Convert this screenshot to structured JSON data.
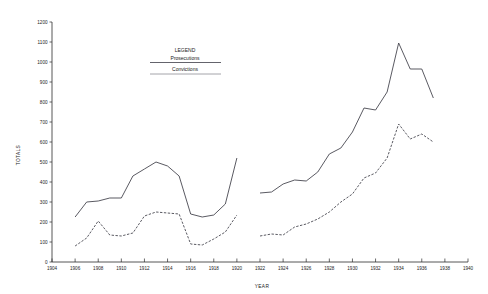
{
  "chart_data": {
    "type": "line",
    "title": "",
    "xlabel": "YEAR",
    "ylabel": "TOTALS",
    "xlim": [
      1904,
      1940
    ],
    "ylim": [
      0,
      1200
    ],
    "grid": false,
    "legend": {
      "title": "LEGEND",
      "position": "upper-center",
      "entries": [
        {
          "label": "Prosecutions",
          "style": "solid"
        },
        {
          "label": "Convictions",
          "style": "dashed"
        }
      ]
    },
    "x_ticks": [
      1904,
      1906,
      1908,
      1910,
      1912,
      1914,
      1916,
      1918,
      1920,
      1922,
      1924,
      1926,
      1928,
      1930,
      1932,
      1934,
      1936,
      1938,
      1940
    ],
    "y_ticks": [
      0,
      100,
      200,
      300,
      400,
      500,
      600,
      700,
      800,
      900,
      1000,
      1100,
      1200
    ],
    "series": [
      {
        "name": "Prosecutions",
        "style": "solid",
        "segments": [
          {
            "x": [
              1906,
              1907,
              1908,
              1909,
              1910,
              1911,
              1912,
              1913,
              1914,
              1915,
              1916,
              1917,
              1918,
              1919,
              1920
            ],
            "y": [
              225,
              300,
              305,
              320,
              320,
              430,
              465,
              500,
              480,
              430,
              240,
              225,
              235,
              290,
              520
            ]
          },
          {
            "x": [
              1922,
              1923,
              1924,
              1925,
              1926,
              1927,
              1928,
              1929,
              1930,
              1931,
              1932,
              1933,
              1934,
              1935,
              1936,
              1937
            ],
            "y": [
              345,
              350,
              390,
              410,
              405,
              450,
              540,
              570,
              650,
              770,
              760,
              850,
              1095,
              965,
              965,
              820
            ]
          }
        ]
      },
      {
        "name": "Convictions",
        "style": "dashed",
        "segments": [
          {
            "x": [
              1906,
              1907,
              1908,
              1909,
              1910,
              1911,
              1912,
              1913,
              1914,
              1915,
              1916,
              1917,
              1918,
              1919,
              1920
            ],
            "y": [
              80,
              120,
              205,
              135,
              130,
              145,
              230,
              250,
              245,
              240,
              90,
              85,
              115,
              150,
              235
            ]
          },
          {
            "x": [
              1922,
              1923,
              1924,
              1925,
              1926,
              1927,
              1928,
              1929,
              1930,
              1931,
              1932,
              1933,
              1934,
              1935,
              1936,
              1937
            ],
            "y": [
              130,
              140,
              135,
              175,
              190,
              215,
              250,
              300,
              340,
              420,
              445,
              520,
              690,
              615,
              640,
              600
            ]
          }
        ]
      }
    ]
  },
  "axes": {
    "y_title": "TOTALS",
    "x_title": "YEAR",
    "y_tick_labels": [
      "0",
      "100",
      "200",
      "300",
      "400",
      "500",
      "600",
      "700",
      "800",
      "900",
      "1000",
      "1100",
      "1200"
    ],
    "x_tick_labels": [
      "1904",
      "1906",
      "1908",
      "1910",
      "1912",
      "1914",
      "1916",
      "1918",
      "1920",
      "1922",
      "1924",
      "1926",
      "1928",
      "1930",
      "1932",
      "1934",
      "1936",
      "1938",
      "1940"
    ]
  },
  "legend": {
    "title": "LEGEND",
    "prosecutions_label": "Prosecutions",
    "convictions_label": "Convictions"
  },
  "colors": {
    "line": "#3c3c46",
    "axis": "#2b2b2b",
    "background": "#ffffff"
  }
}
